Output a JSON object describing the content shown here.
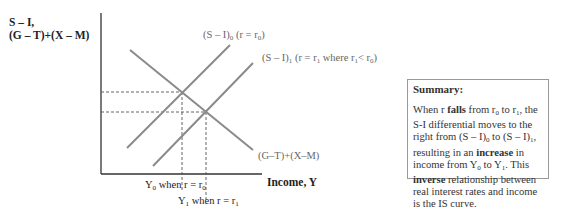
{
  "diagram": {
    "y_axis_label_line1": "S – I,",
    "y_axis_label_line2": "(G – T)+(X – M)",
    "x_axis_label": "Income, Y",
    "curves": [
      {
        "id": "si0",
        "name": "(S – I)",
        "sub": "0",
        "suffix_pre": " (r = r",
        "suffix_sub": "0",
        "suffix_post": ")"
      },
      {
        "id": "si1",
        "name": "(S – I)",
        "sub": "1",
        "suffix_pre": " (r = r",
        "suffix_sub": "1",
        "suffix_mid": " where r",
        "suffix_sub2": "1",
        "suffix_mid2": "< r",
        "suffix_sub3": "0",
        "suffix_post": ")"
      },
      {
        "id": "gtxm",
        "label": "(G–T)+(X–M)"
      }
    ],
    "y0_label": {
      "pre": "Y",
      "sub": "0",
      "mid": " when r = r",
      "sub2": "0"
    },
    "y1_label": {
      "pre": "Y",
      "sub": "1",
      "mid": " when r = r",
      "sub2": "1"
    },
    "colors": {
      "axis": "#333333",
      "curve": "#8a8a8a",
      "dashed": "#555555"
    }
  },
  "summary": {
    "title": "Summary:",
    "t1": "When r ",
    "b1": "falls",
    "t2": " from r",
    "s1": "0",
    "t3": " to r",
    "s2": "1",
    "t4": ", the S-I differential moves to the right from (S – I)",
    "s3": "0",
    "t5": " to (S – I)",
    "s4": "1",
    "t6": ", resulting in an ",
    "b2": "increase",
    "t7": " in income from Y",
    "s5": "0",
    "t8": " to Y",
    "s6": "1",
    "t9": ". This ",
    "b3": "inverse",
    "t10": " relationship between real interest rates and income is the IS curve."
  }
}
